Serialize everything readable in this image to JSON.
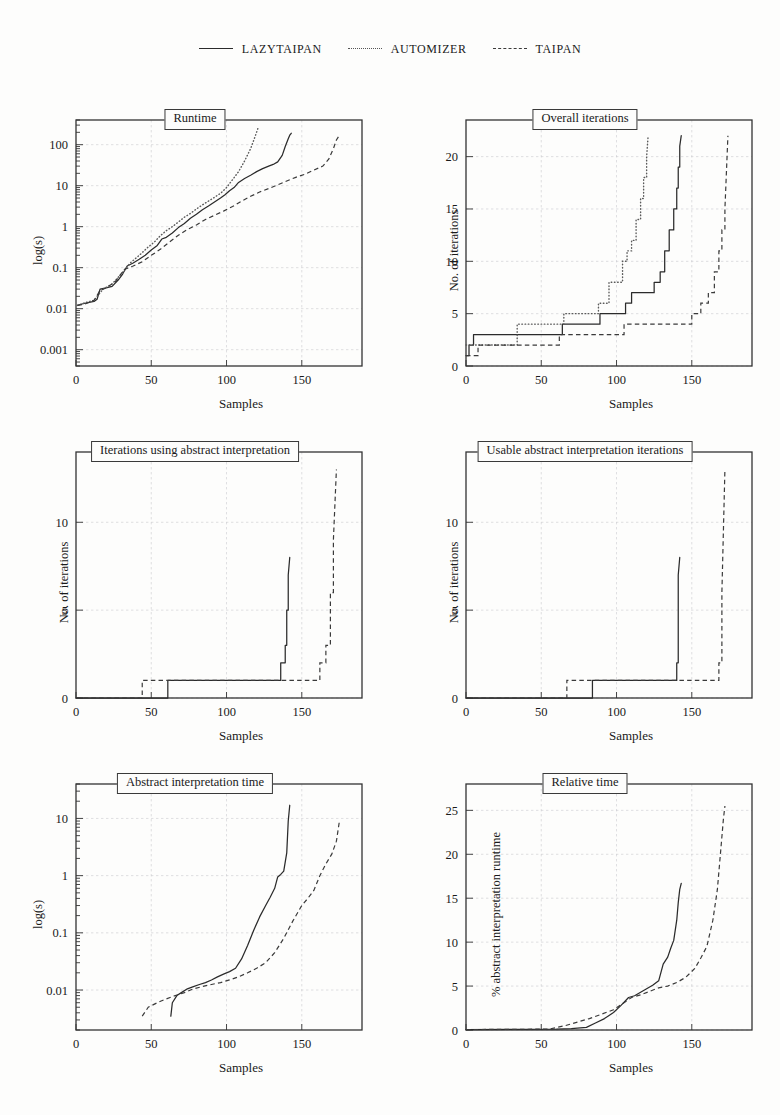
{
  "legend": {
    "entries": [
      {
        "label": "LazyTaipan",
        "style": "solid",
        "icon": "solid-line-icon"
      },
      {
        "label": "Automizer",
        "style": "dotted",
        "icon": "dotted-line-icon"
      },
      {
        "label": "Taipan",
        "style": "dashed",
        "icon": "dashed-line-icon"
      }
    ]
  },
  "chart_data": [
    {
      "type": "line",
      "title": "Runtime",
      "xlabel": "Samples",
      "ylabel": "log(s)",
      "xlim": [
        0,
        190
      ],
      "ylim": [
        0.0004,
        400
      ],
      "yscale": "log",
      "grid": true,
      "xticks": [
        0,
        50,
        100,
        150
      ],
      "yticks": [
        0.001,
        0.01,
        0.1,
        1,
        10,
        100
      ],
      "ytick_labels": [
        "0.001",
        "0.01",
        "0.1",
        "1",
        "10",
        "100"
      ],
      "legend_position": "figure-top",
      "series": [
        {
          "name": "LazyTaipan",
          "style": "solid",
          "x": [
            1,
            4,
            8,
            12,
            14,
            16,
            20,
            24,
            28,
            31,
            34,
            38,
            42,
            46,
            50,
            54,
            57,
            60,
            64,
            68,
            72,
            76,
            80,
            84,
            88,
            92,
            96,
            99,
            102,
            105,
            108,
            112,
            116,
            120,
            124,
            128,
            131,
            134,
            137,
            139,
            141,
            142,
            143
          ],
          "y": [
            0.012,
            0.013,
            0.014,
            0.015,
            0.017,
            0.03,
            0.032,
            0.035,
            0.05,
            0.07,
            0.11,
            0.13,
            0.16,
            0.2,
            0.27,
            0.35,
            0.5,
            0.55,
            0.7,
            0.95,
            1.2,
            1.6,
            2.0,
            2.6,
            3.2,
            4.0,
            5.0,
            6.0,
            7.5,
            9.0,
            12,
            15,
            18,
            22,
            26,
            30,
            33,
            38,
            55,
            90,
            140,
            170,
            190
          ]
        },
        {
          "name": "Automizer",
          "style": "dotted",
          "x": [
            1,
            6,
            12,
            18,
            24,
            30,
            36,
            42,
            48,
            52,
            56,
            60,
            64,
            68,
            72,
            76,
            80,
            84,
            88,
            92,
            96,
            100,
            104,
            108,
            112,
            116,
            119,
            121
          ],
          "y": [
            0.012,
            0.014,
            0.016,
            0.03,
            0.04,
            0.07,
            0.13,
            0.2,
            0.32,
            0.42,
            0.6,
            0.8,
            1.0,
            1.3,
            1.7,
            2.1,
            2.7,
            3.4,
            4.2,
            5.2,
            6.5,
            9.0,
            14,
            22,
            40,
            80,
            160,
            260
          ]
        },
        {
          "name": "Taipan",
          "style": "dashed",
          "x": [
            1,
            6,
            12,
            16,
            20,
            26,
            32,
            38,
            44,
            50,
            56,
            62,
            68,
            74,
            80,
            86,
            92,
            98,
            104,
            110,
            116,
            122,
            128,
            134,
            140,
            146,
            152,
            158,
            164,
            168,
            171,
            173,
            175
          ],
          "y": [
            0.012,
            0.013,
            0.016,
            0.028,
            0.032,
            0.045,
            0.09,
            0.11,
            0.14,
            0.2,
            0.28,
            0.42,
            0.62,
            0.85,
            1.1,
            1.5,
            1.9,
            2.4,
            3.1,
            4.2,
            5.5,
            7.0,
            8.5,
            10.5,
            13,
            16,
            19,
            24,
            30,
            45,
            80,
            130,
            170
          ]
        }
      ]
    },
    {
      "type": "line",
      "title": "Overall iterations",
      "xlabel": "Samples",
      "ylabel": "No. of iterations",
      "xlim": [
        0,
        190
      ],
      "ylim": [
        0,
        23.5
      ],
      "yscale": "linear",
      "grid": true,
      "xticks": [
        0,
        50,
        100,
        150
      ],
      "yticks": [
        0,
        5,
        10,
        15,
        20
      ],
      "ytick_labels": [
        "0",
        "5",
        "10",
        "15",
        "20"
      ],
      "legend_position": "figure-top",
      "series": [
        {
          "name": "LazyTaipan",
          "style": "solid",
          "x": [
            0,
            2,
            2,
            5,
            5,
            35,
            35,
            64,
            64,
            89,
            89,
            106,
            106,
            110,
            110,
            118,
            118,
            125,
            125,
            129,
            129,
            132,
            132,
            135,
            135,
            138,
            138,
            140,
            140,
            141,
            141,
            142,
            142,
            143
          ],
          "y": [
            1,
            1,
            2,
            2,
            3,
            3,
            3,
            3,
            4,
            4,
            5,
            5,
            6,
            6,
            7,
            7,
            7,
            7,
            8,
            8,
            9,
            9,
            11,
            11,
            13,
            13,
            15,
            15,
            17,
            17,
            19,
            19,
            21,
            22
          ]
        },
        {
          "name": "Automizer",
          "style": "dotted",
          "x": [
            0,
            34,
            34,
            52,
            52,
            65,
            65,
            80,
            80,
            88,
            88,
            95,
            95,
            100,
            100,
            104,
            104,
            107,
            107,
            110,
            110,
            113,
            113,
            116,
            116,
            118,
            118,
            120,
            120,
            121
          ],
          "y": [
            2,
            2,
            4,
            4,
            4,
            4,
            5,
            5,
            5,
            5,
            6,
            6,
            8,
            8,
            8,
            8,
            10,
            10,
            11,
            11,
            12,
            12,
            14,
            14,
            16,
            16,
            18,
            18,
            20,
            22
          ]
        },
        {
          "name": "Taipan",
          "style": "dashed",
          "x": [
            0,
            8,
            8,
            62,
            62,
            88,
            88,
            105,
            105,
            130,
            130,
            150,
            150,
            156,
            156,
            161,
            161,
            165,
            165,
            168,
            168,
            170,
            170,
            172,
            172,
            174
          ],
          "y": [
            1,
            1,
            2,
            2,
            3,
            3,
            3,
            3,
            4,
            4,
            4,
            4,
            5,
            5,
            6,
            6,
            7,
            7,
            9,
            9,
            11,
            11,
            13,
            13,
            15,
            22
          ]
        }
      ]
    },
    {
      "type": "line",
      "title": "Iterations using abstract interpretation",
      "xlabel": "Samples",
      "ylabel": "No. of iterations",
      "xlim": [
        0,
        190
      ],
      "ylim": [
        0,
        14
      ],
      "yscale": "linear",
      "grid": true,
      "xticks": [
        0,
        50,
        100,
        150
      ],
      "yticks": [
        0,
        5,
        10
      ],
      "ytick_labels": [
        "0",
        "5",
        "10"
      ],
      "legend_position": "figure-top",
      "series": [
        {
          "name": "LazyTaipan",
          "style": "solid",
          "x": [
            0,
            61,
            61,
            133,
            133,
            136,
            136,
            139,
            139,
            140,
            140,
            141,
            141,
            142
          ],
          "y": [
            0,
            0,
            1,
            1,
            1,
            1,
            2,
            2,
            3,
            3,
            5,
            5,
            7,
            8
          ]
        },
        {
          "name": "Taipan",
          "style": "dashed",
          "x": [
            0,
            44,
            44,
            157,
            157,
            162,
            162,
            166,
            166,
            169,
            169,
            171,
            171,
            173
          ],
          "y": [
            0,
            0,
            1,
            1,
            1,
            1,
            2,
            2,
            3,
            3,
            6,
            6,
            9,
            13
          ]
        }
      ]
    },
    {
      "type": "line",
      "title": "Usable abstract interpretation iterations",
      "xlabel": "Samples",
      "ylabel": "No. of iterations",
      "xlim": [
        0,
        190
      ],
      "ylim": [
        0,
        14
      ],
      "yscale": "linear",
      "grid": true,
      "xticks": [
        0,
        50,
        100,
        150
      ],
      "yticks": [
        0,
        5,
        10
      ],
      "ytick_labels": [
        "0",
        "5",
        "10"
      ],
      "legend_position": "figure-top",
      "series": [
        {
          "name": "LazyTaipan",
          "style": "solid",
          "x": [
            0,
            84,
            84,
            138,
            138,
            140,
            140,
            141,
            141,
            142
          ],
          "y": [
            0,
            0,
            1,
            1,
            1,
            1,
            2,
            2,
            7,
            8
          ]
        },
        {
          "name": "Taipan",
          "style": "dashed",
          "x": [
            0,
            67,
            67,
            164,
            164,
            168,
            168,
            170,
            170,
            172
          ],
          "y": [
            0,
            0,
            1,
            1,
            1,
            1,
            2,
            2,
            6,
            13
          ]
        }
      ]
    },
    {
      "type": "line",
      "title": "Abstract interpretation time",
      "xlabel": "Samples",
      "ylabel": "log(s)",
      "xlim": [
        0,
        190
      ],
      "ylim": [
        0.002,
        40
      ],
      "yscale": "log",
      "grid": true,
      "xticks": [
        0,
        50,
        100,
        150
      ],
      "yticks": [
        0.01,
        0.1,
        1,
        10
      ],
      "ytick_labels": [
        "0.01",
        "0.1",
        "1",
        "10"
      ],
      "legend_position": "figure-top",
      "series": [
        {
          "name": "LazyTaipan",
          "style": "solid",
          "x": [
            63,
            64,
            67,
            70,
            74,
            78,
            82,
            86,
            90,
            94,
            98,
            102,
            106,
            110,
            114,
            118,
            122,
            126,
            129,
            132,
            134,
            136,
            138,
            140,
            141,
            142
          ],
          "y": [
            0.0035,
            0.006,
            0.008,
            0.009,
            0.0105,
            0.0115,
            0.0125,
            0.0135,
            0.015,
            0.017,
            0.019,
            0.021,
            0.024,
            0.035,
            0.06,
            0.11,
            0.19,
            0.3,
            0.42,
            0.6,
            0.95,
            1.05,
            1.2,
            2.5,
            9,
            17
          ]
        },
        {
          "name": "Taipan",
          "style": "dashed",
          "x": [
            44,
            48,
            54,
            60,
            66,
            72,
            78,
            84,
            90,
            96,
            102,
            108,
            114,
            120,
            126,
            132,
            138,
            144,
            150,
            154,
            158,
            162,
            166,
            170,
            173,
            175
          ],
          "y": [
            0.0035,
            0.005,
            0.006,
            0.007,
            0.008,
            0.009,
            0.0105,
            0.0115,
            0.0125,
            0.0135,
            0.015,
            0.017,
            0.02,
            0.024,
            0.03,
            0.045,
            0.08,
            0.16,
            0.3,
            0.4,
            0.55,
            1.0,
            1.6,
            2.4,
            4.0,
            9.0
          ]
        }
      ]
    },
    {
      "type": "line",
      "title": "Relative time",
      "xlabel": "Samples",
      "ylabel": "% abstract interpretation runtime",
      "xlim": [
        0,
        190
      ],
      "ylim": [
        0,
        28
      ],
      "yscale": "linear",
      "grid": true,
      "xticks": [
        0,
        50,
        100,
        150
      ],
      "yticks": [
        0,
        5,
        10,
        15,
        20,
        25
      ],
      "ytick_labels": [
        "0",
        "5",
        "10",
        "15",
        "20",
        "25"
      ],
      "legend_position": "figure-top",
      "series": [
        {
          "name": "LazyTaipan",
          "style": "solid",
          "x": [
            0,
            60,
            70,
            80,
            86,
            92,
            98,
            103,
            108,
            112,
            116,
            120,
            124,
            128,
            131,
            134,
            136,
            138,
            140,
            141,
            142,
            143
          ],
          "y": [
            0.05,
            0.1,
            0.15,
            0.3,
            0.8,
            1.3,
            2.0,
            2.8,
            3.7,
            3.9,
            4.3,
            4.7,
            5.1,
            5.6,
            7.5,
            8.3,
            9.3,
            10.2,
            12.5,
            14.5,
            16.0,
            16.7
          ]
        },
        {
          "name": "Taipan",
          "style": "dashed",
          "x": [
            0,
            55,
            66,
            74,
            82,
            90,
            98,
            104,
            110,
            116,
            122,
            128,
            134,
            140,
            146,
            152,
            156,
            160,
            164,
            167,
            169,
            171,
            172
          ],
          "y": [
            0.05,
            0.1,
            0.5,
            0.9,
            1.3,
            1.8,
            2.3,
            3.0,
            3.7,
            4.0,
            4.4,
            4.8,
            5.0,
            5.4,
            6.0,
            7.0,
            8.2,
            9.5,
            12.5,
            16.0,
            20.0,
            24.0,
            25.5
          ]
        }
      ]
    }
  ]
}
